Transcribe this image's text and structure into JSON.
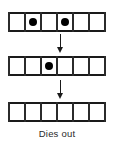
{
  "figure": {
    "caption": "Dies out",
    "colors": {
      "rail": "#1a1a1a",
      "divider": "#2b2b2b",
      "cell_alive": "#000000",
      "background": "#ffffff",
      "caption_text": "#2a2a2a",
      "arrow": "#1a1a1a"
    }
  },
  "chart_data": {
    "type": "heatmap",
    "title": "Dies out",
    "xlabel": "",
    "ylabel": "",
    "cells_per_row": 6,
    "generations": 3,
    "categories": [
      "1",
      "2",
      "3",
      "4",
      "5",
      "6"
    ],
    "series": [
      {
        "name": "generation-1",
        "values": [
          0,
          1,
          0,
          1,
          0,
          0
        ]
      },
      {
        "name": "generation-2",
        "values": [
          0,
          0,
          1,
          0,
          0,
          0
        ]
      },
      {
        "name": "generation-3",
        "values": [
          0,
          0,
          0,
          0,
          0,
          0
        ]
      }
    ],
    "live_cell_counts": [
      2,
      1,
      0
    ],
    "arrows": [
      "down",
      "down"
    ],
    "legend": [],
    "grid": true
  },
  "rows": [
    {
      "name": "generation-1",
      "cells": [
        {
          "index": 1,
          "alive": false
        },
        {
          "index": 2,
          "alive": true
        },
        {
          "index": 3,
          "alive": false
        },
        {
          "index": 4,
          "alive": true
        },
        {
          "index": 5,
          "alive": false
        },
        {
          "index": 6,
          "alive": false
        }
      ]
    },
    {
      "name": "generation-2",
      "cells": [
        {
          "index": 1,
          "alive": false
        },
        {
          "index": 2,
          "alive": false
        },
        {
          "index": 3,
          "alive": true
        },
        {
          "index": 4,
          "alive": false
        },
        {
          "index": 5,
          "alive": false
        },
        {
          "index": 6,
          "alive": false
        }
      ]
    },
    {
      "name": "generation-3",
      "cells": [
        {
          "index": 1,
          "alive": false
        },
        {
          "index": 2,
          "alive": false
        },
        {
          "index": 3,
          "alive": false
        },
        {
          "index": 4,
          "alive": false
        },
        {
          "index": 5,
          "alive": false
        },
        {
          "index": 6,
          "alive": false
        }
      ]
    }
  ],
  "arrows": [
    {
      "name": "transition-arrow-1",
      "direction": "down",
      "icon": "arrow-down-icon"
    },
    {
      "name": "transition-arrow-2",
      "direction": "down",
      "icon": "arrow-down-icon"
    }
  ]
}
